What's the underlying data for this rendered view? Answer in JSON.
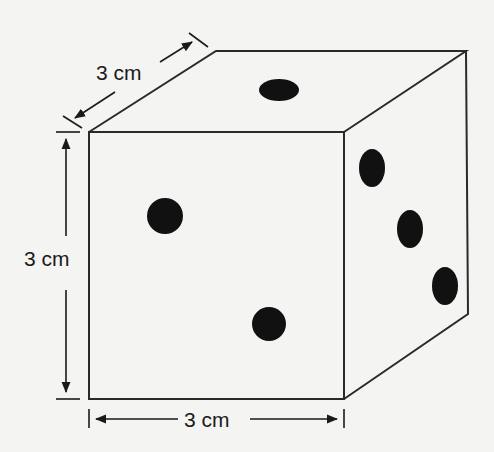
{
  "figure": {
    "colors": {
      "background": "#f4f4f2",
      "line": "#2a2a2a",
      "pip": "#111111"
    },
    "dimensions": {
      "depth": {
        "label": "3 cm"
      },
      "height": {
        "label": "3 cm"
      },
      "width": {
        "label": "3 cm"
      }
    },
    "faces": {
      "top": {
        "pips": 1
      },
      "front": {
        "pips": 2
      },
      "side": {
        "pips": 3
      }
    }
  }
}
